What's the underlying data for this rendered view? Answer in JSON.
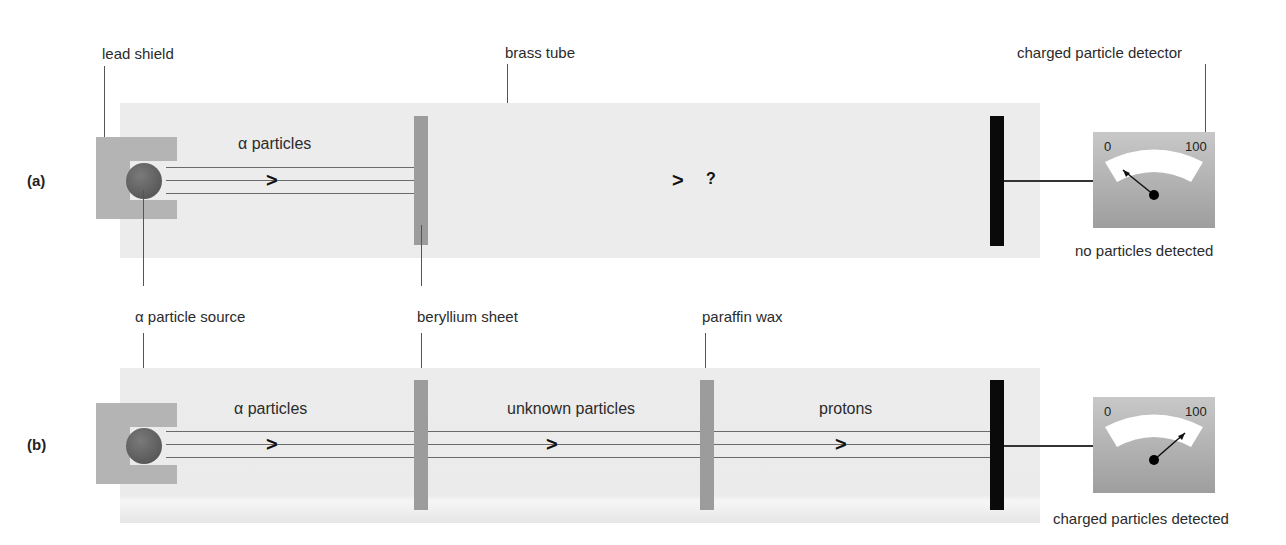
{
  "figure": {
    "panels": [
      {
        "id": "a",
        "label": "(a)",
        "beam_labels": [
          "α particles"
        ],
        "unknown_marker": "?",
        "meter": {
          "min_label": "0",
          "max_label": "100",
          "needle": "low",
          "status": "no particles detected"
        }
      },
      {
        "id": "b",
        "label": "(b)",
        "beam_labels": [
          "α particles",
          "unknown particles",
          "protons"
        ],
        "meter": {
          "min_label": "0",
          "max_label": "100",
          "needle": "high",
          "status": "charged particles detected"
        }
      }
    ],
    "callouts": {
      "lead_shield": "lead shield",
      "brass_tube": "brass tube",
      "detector": "charged particle detector",
      "source": "α particle source",
      "beryllium": "beryllium sheet",
      "paraffin": "paraffin wax"
    },
    "colors": {
      "tube": "#ececec",
      "shield": "#b4b4b4",
      "sheet": "#9c9c9c",
      "plate": "#0a0a0a",
      "meter": "#b0b0b0"
    }
  }
}
